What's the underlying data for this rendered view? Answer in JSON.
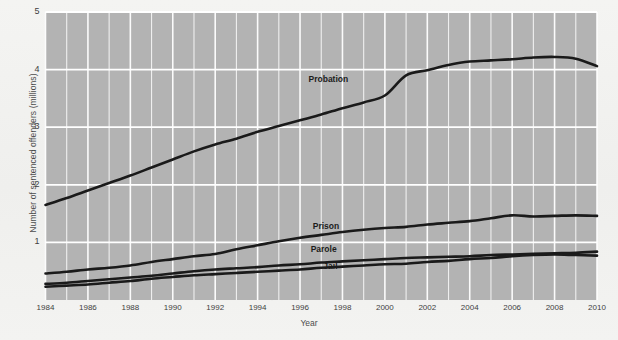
{
  "chart_data": {
    "type": "line",
    "title": "",
    "xlabel": "Year",
    "ylabel": "Number of sentenced offenders (millions)",
    "xlim": [
      1984,
      2010
    ],
    "ylim": [
      0,
      5
    ],
    "xticks": [
      "1984",
      "1986",
      "1988",
      "1990",
      "1992",
      "1994",
      "1996",
      "1998",
      "2000",
      "2002",
      "2004",
      "2006",
      "2008",
      "2010"
    ],
    "yticks": [
      "1",
      "2",
      "3",
      "4",
      "5"
    ],
    "grid": "both-axes-white-gridlines",
    "legend": "inline-series-labels",
    "plot_background": "#b3b3b3",
    "gridline_color": "#ffffff",
    "line_color": "#1a1a1a",
    "x": [
      1984,
      1985,
      1986,
      1987,
      1988,
      1989,
      1990,
      1991,
      1992,
      1993,
      1994,
      1995,
      1996,
      1997,
      1998,
      1999,
      2000,
      2001,
      2002,
      2003,
      2004,
      2005,
      2006,
      2007,
      2008,
      2009,
      2010
    ],
    "series": [
      {
        "name": "Probation",
        "label": "Probation",
        "label_x": 1996.4,
        "label_y": 3.82,
        "values": [
          1.65,
          1.77,
          1.9,
          2.03,
          2.16,
          2.3,
          2.44,
          2.58,
          2.7,
          2.8,
          2.92,
          3.02,
          3.12,
          3.22,
          3.33,
          3.43,
          3.55,
          3.9,
          3.99,
          4.08,
          4.14,
          4.16,
          4.18,
          4.21,
          4.22,
          4.19,
          4.06
        ]
      },
      {
        "name": "Prison",
        "label": "Prison",
        "label_x": 1996.6,
        "label_y": 1.27,
        "values": [
          0.46,
          0.49,
          0.53,
          0.56,
          0.6,
          0.66,
          0.71,
          0.76,
          0.8,
          0.88,
          0.95,
          1.02,
          1.08,
          1.13,
          1.18,
          1.22,
          1.25,
          1.27,
          1.31,
          1.34,
          1.37,
          1.42,
          1.47,
          1.45,
          1.46,
          1.47,
          1.46
        ]
      },
      {
        "name": "Parole",
        "label": "Parole",
        "label_x": 1996.5,
        "label_y": 0.86,
        "values": [
          0.28,
          0.3,
          0.33,
          0.36,
          0.39,
          0.42,
          0.46,
          0.5,
          0.53,
          0.55,
          0.57,
          0.6,
          0.62,
          0.65,
          0.67,
          0.69,
          0.71,
          0.73,
          0.74,
          0.75,
          0.76,
          0.78,
          0.79,
          0.8,
          0.81,
          0.82,
          0.84
        ]
      },
      {
        "name": "Jail",
        "label": "Jail",
        "label_x": 1997.1,
        "label_y": 0.58,
        "values": [
          0.23,
          0.25,
          0.27,
          0.3,
          0.33,
          0.37,
          0.4,
          0.43,
          0.45,
          0.47,
          0.49,
          0.51,
          0.53,
          0.56,
          0.58,
          0.6,
          0.62,
          0.63,
          0.66,
          0.68,
          0.71,
          0.73,
          0.76,
          0.78,
          0.79,
          0.78,
          0.77
        ]
      }
    ]
  }
}
